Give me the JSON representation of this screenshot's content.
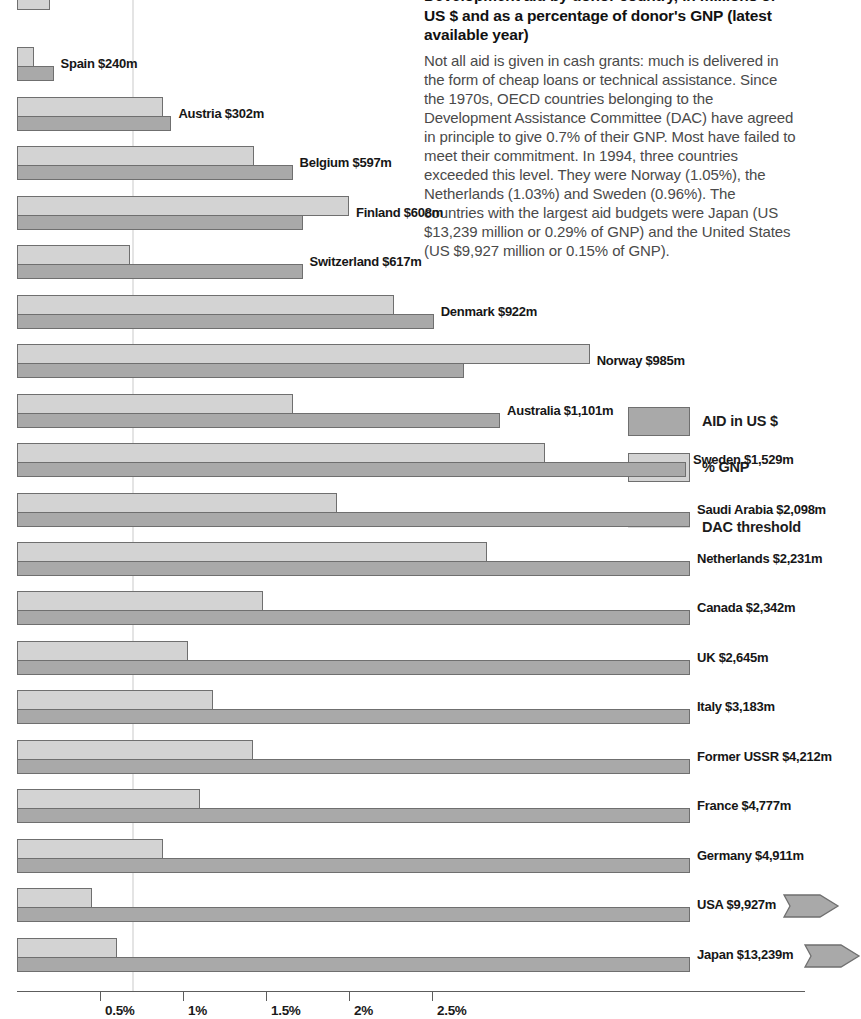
{
  "header": {
    "title": "Development aid by donor country, in millions of US $ and as a percentage of donor's GNP (latest available year)",
    "body": "Not all aid is given in cash grants: much is delivered in the form of cheap loans or technical assistance. Since the 1970s, OECD countries belonging to the Development Assistance Committee (DAC) have agreed in principle to give 0.7% of their GNP. Most have failed to meet their commitment. In 1994, three countries exceeded this level. They were Norway (1.05%), the Netherlands (1.03%) and Sweden (0.96%). The countries with the largest aid budgets were Japan (US $13,239 million or 0.29% of GNP) and the United States (US $9,927 million or 0.15% of GNP)."
  },
  "legend": {
    "items": [
      {
        "label": "AID in US $",
        "swatch": "aid",
        "color": "#a9a9a9"
      },
      {
        "label": "% GNP",
        "swatch": "gnp",
        "color": "#d3d3d3"
      },
      {
        "label": "DAC threshold",
        "swatch": "line",
        "color": "#dadada"
      }
    ]
  },
  "chart_data": {
    "type": "bar",
    "title": "Development aid by donor country, in millions of US $ and as a percentage of donor's GNP (latest available year)",
    "orientation": "horizontal",
    "grid": false,
    "legend_position": "right",
    "xlabel": "",
    "ylabel": "",
    "xlim": [
      0,
      4.75
    ],
    "xticks": [
      0.5,
      1,
      1.5,
      2,
      2.5
    ],
    "xtick_labels": [
      "0.5%",
      "1%",
      "1.5%",
      "2%",
      "2.5%"
    ],
    "dac_threshold": 0.7,
    "dac_threshold_label": "DAC threshold",
    "series": [
      {
        "name": "AID in US $",
        "unit": "US $ million",
        "color": "#a9a9a9"
      },
      {
        "name": "% GNP",
        "unit": "percent of GNP",
        "color": "#d3d3d3"
      }
    ],
    "rows": [
      {
        "country": "",
        "label": "",
        "aid_musd": 0,
        "gnp_pct": 0.2,
        "aid_plot": 0.12,
        "clipped_top": true,
        "offscale": false
      },
      {
        "country": "Spain",
        "label": "Spain $240m",
        "aid_musd": 240,
        "gnp_pct": 0.1,
        "aid_plot": 0.22,
        "clipped_top": false,
        "offscale": false
      },
      {
        "country": "Austria",
        "label": "Austria $302m",
        "aid_musd": 302,
        "gnp_pct": 0.88,
        "aid_plot": 0.93,
        "clipped_top": false,
        "offscale": false
      },
      {
        "country": "Belgium",
        "label": "Belgium $597m",
        "aid_musd": 597,
        "gnp_pct": 1.43,
        "aid_plot": 1.66,
        "clipped_top": false,
        "offscale": false
      },
      {
        "country": "Finland",
        "label": "Finland $608m",
        "aid_musd": 608,
        "gnp_pct": 2.0,
        "aid_plot": 1.72,
        "clipped_top": false,
        "offscale": false
      },
      {
        "country": "Switzerland",
        "label": "Switzerland $617m",
        "aid_musd": 617,
        "gnp_pct": 0.68,
        "aid_plot": 1.72,
        "clipped_top": false,
        "offscale": false
      },
      {
        "country": "Denmark",
        "label": "Denmark $922m",
        "aid_musd": 922,
        "gnp_pct": 2.27,
        "aid_plot": 2.51,
        "clipped_top": false,
        "offscale": false
      },
      {
        "country": "Norway",
        "label": "Norway $985m",
        "aid_musd": 985,
        "gnp_pct": 3.45,
        "aid_plot": 2.69,
        "clipped_top": false,
        "offscale": false
      },
      {
        "country": "Australia",
        "label": "Australia $1,101m",
        "aid_musd": 1101,
        "gnp_pct": 1.66,
        "aid_plot": 2.91,
        "clipped_top": false,
        "offscale": false
      },
      {
        "country": "Sweden",
        "label": "Sweden $1,529m",
        "aid_musd": 1529,
        "gnp_pct": 3.18,
        "aid_plot": 4.03,
        "clipped_top": false,
        "offscale": false
      },
      {
        "country": "Saudi Arabia",
        "label": "Saudi Arabia $2,098m",
        "aid_musd": 2098,
        "gnp_pct": 1.93,
        "aid_plot": 4.64,
        "clipped_top": false,
        "offscale": false
      },
      {
        "country": "Netherlands",
        "label": "Netherlands $2,231m",
        "aid_musd": 2231,
        "gnp_pct": 2.83,
        "aid_plot": 4.94,
        "clipped_top": false,
        "offscale": false
      },
      {
        "country": "Canada",
        "label": "Canada $2,342m",
        "aid_musd": 2342,
        "gnp_pct": 1.48,
        "aid_plot": 5.18,
        "clipped_top": false,
        "offscale": false
      },
      {
        "country": "UK",
        "label": "UK $2,645m",
        "aid_musd": 2645,
        "gnp_pct": 1.03,
        "aid_plot": 5.85,
        "clipped_top": false,
        "offscale": false
      },
      {
        "country": "Italy",
        "label": "Italy $3,183m",
        "aid_musd": 3183,
        "gnp_pct": 1.18,
        "aid_plot": 7.04,
        "clipped_top": false,
        "offscale": false
      },
      {
        "country": "Former USSR",
        "label": "Former USSR $4,212m",
        "aid_musd": 4212,
        "gnp_pct": 1.42,
        "aid_plot": 9.32,
        "clipped_top": false,
        "offscale": false
      },
      {
        "country": "France",
        "label": "France $4,777m",
        "aid_musd": 4777,
        "gnp_pct": 1.1,
        "aid_plot": 10.57,
        "clipped_top": false,
        "offscale": false
      },
      {
        "country": "Germany",
        "label": "Germany $4,911m",
        "aid_musd": 4911,
        "gnp_pct": 0.88,
        "aid_plot": 10.86,
        "clipped_top": false,
        "offscale": false
      },
      {
        "country": "USA",
        "label": "USA $9,927m",
        "aid_musd": 9927,
        "gnp_pct": 0.45,
        "aid_plot": 21.96,
        "clipped_top": false,
        "offscale": true
      },
      {
        "country": "Japan",
        "label": "Japan $13,239m",
        "aid_musd": 13239,
        "gnp_pct": 0.6,
        "aid_plot": 29.28,
        "clipped_top": false,
        "offscale": true
      }
    ]
  },
  "axis": {
    "labels": [
      "0.5%",
      "1%",
      "1.5%",
      "2%",
      "2.5%"
    ]
  }
}
